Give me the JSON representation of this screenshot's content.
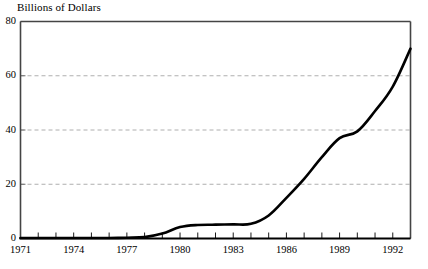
{
  "chart_data": {
    "type": "line",
    "title": "",
    "ylabel": "Billions of Dollars",
    "xlabel": "",
    "ylim": [
      0,
      80
    ],
    "xlim": [
      1971,
      1993
    ],
    "grid": "horizontal-dashed",
    "legend": "none",
    "y_ticks": [
      0,
      20,
      40,
      60,
      80
    ],
    "y_tick_labels": [
      "0",
      "20",
      "40",
      "60",
      "80"
    ],
    "x_ticks": [
      1971,
      1972,
      1973,
      1974,
      1975,
      1976,
      1977,
      1978,
      1979,
      1980,
      1981,
      1982,
      1983,
      1984,
      1985,
      1986,
      1987,
      1988,
      1989,
      1990,
      1991,
      1992,
      1993
    ],
    "x_tick_labels": [
      "1971",
      "",
      "",
      "1974",
      "",
      "",
      "1977",
      "",
      "",
      "1980",
      "",
      "",
      "1983",
      "",
      "",
      "1986",
      "",
      "",
      "1989",
      "",
      "",
      "1992",
      ""
    ],
    "x_labeled_ticks": [
      {
        "value": 1971,
        "label": "1971"
      },
      {
        "value": 1974,
        "label": "1974"
      },
      {
        "value": 1977,
        "label": "1977"
      },
      {
        "value": 1980,
        "label": "1980"
      },
      {
        "value": 1983,
        "label": "1983"
      },
      {
        "value": 1986,
        "label": "1986"
      },
      {
        "value": 1989,
        "label": "1989"
      },
      {
        "value": 1992,
        "label": "1992"
      }
    ],
    "series": [
      {
        "name": "Billions of Dollars",
        "color": "#000000",
        "x": [
          1971,
          1972,
          1973,
          1974,
          1975,
          1976,
          1977,
          1978,
          1979,
          1980,
          1981,
          1982,
          1983,
          1984,
          1985,
          1986,
          1987,
          1988,
          1989,
          1990,
          1991,
          1992,
          1993
        ],
        "values": [
          0.2,
          0.2,
          0.2,
          0.2,
          0.2,
          0.2,
          0.3,
          0.5,
          1.8,
          4.2,
          5.0,
          5.1,
          5.2,
          5.4,
          8.5,
          15.0,
          22.0,
          30.0,
          37.0,
          39.5,
          47.0,
          56.0,
          70.0
        ]
      }
    ]
  },
  "axis": {
    "y_title": "Billions of Dollars"
  }
}
